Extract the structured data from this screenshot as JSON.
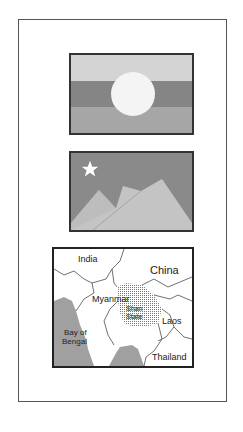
{
  "panels": {
    "flag_sun": {
      "bands": [
        "#d4d4d4",
        "#858585",
        "#a6a6a6"
      ],
      "sun_color": "#f4f4f4",
      "icon": "sun-icon"
    },
    "flag_star_mountains": {
      "sky_color": "#8a8a8a",
      "mountain_color": "#c4c4c4",
      "star_color": "#ffffff",
      "icon": "star-icon"
    },
    "map": {
      "labels": {
        "india": "India",
        "china": "China",
        "myanmar": "Myanmar",
        "shan_state_1": "Shan",
        "shan_state_2": "State",
        "laos": "Laos",
        "bay_1": "Bay of",
        "bay_2": "Bengal",
        "thailand": "Thailand"
      },
      "sea_color": "#a0a0a0"
    }
  }
}
